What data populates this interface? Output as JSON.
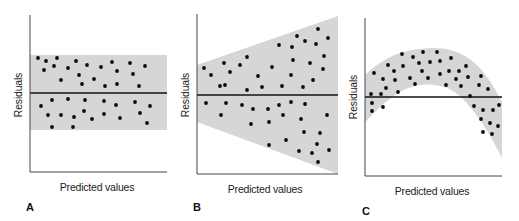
{
  "figure": {
    "background": "#ffffff",
    "band_color": "#d6d6d6",
    "dot_color": "#0a0a0a",
    "zero_line_color": "#111111"
  },
  "chart_data": [
    {
      "type": "scatter",
      "panel": "A",
      "title": "",
      "xlabel": "Predicted values",
      "ylabel": "Residuals",
      "grid": false,
      "legend": null,
      "description": "Residuals randomly scattered in a constant-width horizontal band around zero (homoscedastic)",
      "axes_px": {
        "x0": 30,
        "x1": 167,
        "ytop": 15,
        "ybottom": 172
      },
      "zero_line_y": 93,
      "band_polygon": [
        [
          30,
          55
        ],
        [
          167,
          55
        ],
        [
          167,
          130
        ],
        [
          30,
          130
        ]
      ],
      "points": [
        [
          38,
          58
        ],
        [
          46,
          61
        ],
        [
          57,
          58
        ],
        [
          44,
          70
        ],
        [
          54,
          66
        ],
        [
          68,
          68
        ],
        [
          76,
          61
        ],
        [
          87,
          65
        ],
        [
          101,
          67
        ],
        [
          112,
          62
        ],
        [
          117,
          71
        ],
        [
          130,
          63
        ],
        [
          133,
          74
        ],
        [
          145,
          66
        ],
        [
          61,
          80
        ],
        [
          79,
          75
        ],
        [
          82,
          84
        ],
        [
          94,
          79
        ],
        [
          105,
          86
        ],
        [
          117,
          84
        ],
        [
          139,
          86
        ],
        [
          41,
          106
        ],
        [
          52,
          100
        ],
        [
          68,
          99
        ],
        [
          85,
          100
        ],
        [
          104,
          101
        ],
        [
          116,
          105
        ],
        [
          135,
          102
        ],
        [
          150,
          106
        ],
        [
          48,
          115
        ],
        [
          61,
          115
        ],
        [
          74,
          117
        ],
        [
          84,
          111
        ],
        [
          92,
          119
        ],
        [
          104,
          114
        ],
        [
          120,
          118
        ],
        [
          140,
          113
        ],
        [
          147,
          123
        ],
        [
          52,
          127
        ],
        [
          73,
          127
        ]
      ],
      "label_pos": {
        "letter": [
          30,
          210
        ],
        "xlabel": [
          97,
          190
        ]
      }
    },
    {
      "type": "scatter",
      "panel": "B",
      "title": "",
      "xlabel": "Predicted values",
      "ylabel": "Residuals",
      "grid": false,
      "legend": null,
      "description": "Residual spread widens as predicted values increase (funnel shape, heteroscedastic)",
      "axes_px": {
        "x0": 197,
        "x1": 335,
        "ytop": 14,
        "ybottom": 174
      },
      "zero_line_y": 95,
      "band_polygon": [
        [
          197,
          65
        ],
        [
          338,
          16
        ],
        [
          338,
          174
        ],
        [
          197,
          122
        ]
      ],
      "points": [
        [
          204,
          68
        ],
        [
          211,
          75
        ],
        [
          224,
          63
        ],
        [
          230,
          72
        ],
        [
          220,
          86
        ],
        [
          225,
          85
        ],
        [
          240,
          65
        ],
        [
          247,
          57
        ],
        [
          247,
          90
        ],
        [
          258,
          76
        ],
        [
          262,
          87
        ],
        [
          272,
          67
        ],
        [
          279,
          45
        ],
        [
          282,
          86
        ],
        [
          291,
          75
        ],
        [
          292,
          47
        ],
        [
          293,
          60
        ],
        [
          297,
          36
        ],
        [
          303,
          87
        ],
        [
          305,
          41
        ],
        [
          310,
          63
        ],
        [
          313,
          80
        ],
        [
          316,
          44
        ],
        [
          318,
          29
        ],
        [
          323,
          69
        ],
        [
          324,
          56
        ],
        [
          328,
          38
        ],
        [
          206,
          103
        ],
        [
          221,
          115
        ],
        [
          226,
          103
        ],
        [
          242,
          105
        ],
        [
          251,
          124
        ],
        [
          253,
          109
        ],
        [
          268,
          109
        ],
        [
          269,
          122
        ],
        [
          269,
          145
        ],
        [
          279,
          105
        ],
        [
          283,
          115
        ],
        [
          286,
          140
        ],
        [
          291,
          102
        ],
        [
          299,
          151
        ],
        [
          301,
          119
        ],
        [
          304,
          132
        ],
        [
          305,
          104
        ],
        [
          312,
          153
        ],
        [
          317,
          144
        ],
        [
          318,
          162
        ],
        [
          320,
          133
        ],
        [
          327,
          115
        ],
        [
          329,
          150
        ]
      ],
      "label_pos": {
        "letter": [
          197,
          210
        ],
        "xlabel": [
          265,
          192
        ]
      }
    },
    {
      "type": "scatter",
      "panel": "C",
      "title": "",
      "xlabel": "Predicted values",
      "ylabel": "Residuals",
      "grid": false,
      "legend": null,
      "description": "Residuals follow a curved (inverted-U) pattern, indicating non-linearity",
      "axes_px": {
        "x0": 365,
        "x1": 502,
        "ytop": 18,
        "ybottom": 176
      },
      "zero_line_y": 97,
      "band_upper": [
        [
          365,
          75
        ],
        [
          380,
          62
        ],
        [
          400,
          52
        ],
        [
          430,
          47
        ],
        [
          455,
          50
        ],
        [
          475,
          62
        ],
        [
          490,
          80
        ],
        [
          502,
          102
        ]
      ],
      "band_lower": [
        [
          502,
          158
        ],
        [
          490,
          135
        ],
        [
          475,
          112
        ],
        [
          455,
          90
        ],
        [
          430,
          83
        ],
        [
          405,
          88
        ],
        [
          385,
          102
        ],
        [
          365,
          122
        ]
      ],
      "points": [
        [
          374,
          73
        ],
        [
          371,
          94
        ],
        [
          372,
          103
        ],
        [
          372,
          111
        ],
        [
          383,
          79
        ],
        [
          381,
          94
        ],
        [
          383,
          107
        ],
        [
          386,
          88
        ],
        [
          388,
          65
        ],
        [
          394,
          71
        ],
        [
          395,
          80
        ],
        [
          398,
          92
        ],
        [
          402,
          54
        ],
        [
          403,
          66
        ],
        [
          410,
          78
        ],
        [
          413,
          57
        ],
        [
          415,
          84
        ],
        [
          419,
          63
        ],
        [
          422,
          71
        ],
        [
          423,
          52
        ],
        [
          428,
          78
        ],
        [
          430,
          62
        ],
        [
          437,
          52
        ],
        [
          440,
          61
        ],
        [
          440,
          74
        ],
        [
          446,
          85
        ],
        [
          449,
          71
        ],
        [
          451,
          58
        ],
        [
          456,
          79
        ],
        [
          459,
          71
        ],
        [
          461,
          86
        ],
        [
          466,
          66
        ],
        [
          468,
          77
        ],
        [
          470,
          96
        ],
        [
          474,
          106
        ],
        [
          479,
          85
        ],
        [
          481,
          76
        ],
        [
          481,
          119
        ],
        [
          483,
          110
        ],
        [
          483,
          132
        ],
        [
          488,
          89
        ],
        [
          490,
          123
        ],
        [
          492,
          134
        ],
        [
          493,
          110
        ],
        [
          498,
          126
        ],
        [
          499,
          105
        ]
      ],
      "label_pos": {
        "letter": [
          366,
          214
        ],
        "xlabel": [
          432,
          194
        ]
      }
    }
  ],
  "labels": {
    "panels": [
      {
        "letter": "A",
        "xlabel": "Predicted values",
        "ylabel": "Residuals"
      },
      {
        "letter": "B",
        "xlabel": "Predicted values",
        "ylabel": "Residuals"
      },
      {
        "letter": "C",
        "xlabel": "Predicted values",
        "ylabel": "Residuals"
      }
    ]
  }
}
